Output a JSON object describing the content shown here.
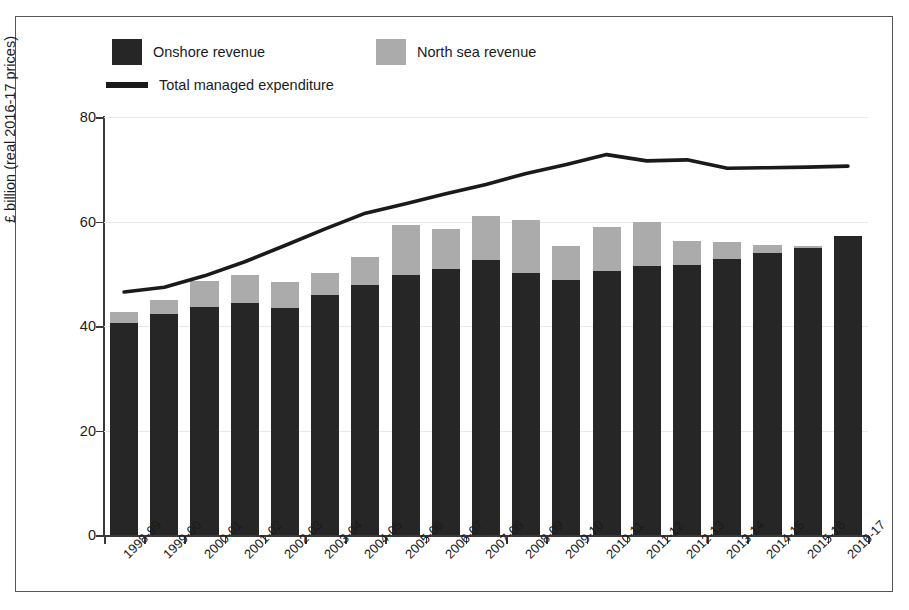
{
  "chart_data": {
    "type": "bar",
    "subtype": "stacked-bar-with-line",
    "title": "",
    "xlabel": "",
    "ylabel": "£ billion (real 2016-17 prices)",
    "ylim": [
      0,
      80
    ],
    "yticks": [
      0,
      20,
      40,
      60,
      80
    ],
    "ytick_labels": [
      "0",
      "20",
      "40",
      "60",
      "80"
    ],
    "grid": true,
    "legend_position": "top-left",
    "categories": [
      "1998-99",
      "1999-00",
      "2000-01",
      "2001-02",
      "2002-03",
      "2003-04",
      "2004-05",
      "2005-06",
      "2006-07",
      "2007-08",
      "2008-09",
      "2009-10",
      "2010-11",
      "2011-12",
      "2012-13",
      "2013-14",
      "2014-15",
      "2015-16",
      "2016-17"
    ],
    "series": [
      {
        "name": "Onshore revenue",
        "type": "bar",
        "stack": "revenue",
        "color": "#262626",
        "values": [
          40.6,
          42.3,
          43.6,
          44.4,
          43.4,
          46.0,
          47.8,
          49.8,
          51.0,
          52.6,
          50.2,
          48.8,
          50.6,
          51.4,
          51.6,
          52.8,
          54.0,
          55.0,
          57.2
        ]
      },
      {
        "name": "North sea revenue",
        "type": "bar",
        "stack": "revenue",
        "color": "#ababab",
        "values": [
          2.1,
          2.6,
          5.1,
          5.4,
          5.0,
          4.2,
          5.5,
          9.6,
          7.6,
          8.5,
          10.1,
          6.5,
          8.3,
          8.5,
          4.6,
          3.3,
          1.5,
          0.4,
          0.0
        ]
      },
      {
        "name": "Total managed expenditure",
        "type": "line",
        "color": "#1a1a1a",
        "values": [
          46.5,
          47.4,
          49.6,
          52.3,
          55.4,
          58.6,
          61.6,
          63.4,
          65.3,
          67.1,
          69.2,
          70.9,
          72.8,
          71.6,
          71.8,
          70.2,
          70.3,
          70.4,
          70.6
        ]
      }
    ]
  },
  "legend": {
    "items": [
      {
        "label": "Onshore revenue",
        "marker": "square",
        "color": "#262626"
      },
      {
        "label": "North sea revenue",
        "marker": "square",
        "color": "#ababab"
      },
      {
        "label": "Total managed expenditure",
        "marker": "line",
        "color": "#1a1a1a"
      }
    ]
  },
  "axis": {
    "y_title": "£ billion (real 2016-17 prices)"
  }
}
